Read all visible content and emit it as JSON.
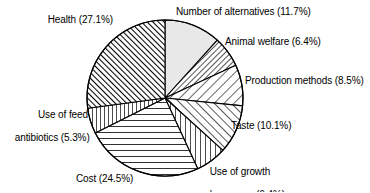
{
  "chart_data": {
    "type": "pie",
    "title": "",
    "subtitle": "",
    "xlabel": "",
    "ylabel": "",
    "legend_position": "none",
    "grid": false,
    "units": "percent",
    "start_angle_deg": 0,
    "direction": "clockwise",
    "categories": [
      "Number of alternatives",
      "Animal welfare",
      "Production methods",
      "Taste",
      "Use of growth hormones",
      "Cost",
      "Use of feed antibiotics",
      "Health"
    ],
    "values": [
      11.7,
      6.4,
      8.5,
      10.1,
      6.4,
      24.5,
      5.3,
      27.1
    ],
    "slices": [
      {
        "name": "Number of alternatives",
        "value": 11.7,
        "label": "Number of alternatives (11.7%)",
        "fill": "solid-lightgray",
        "color": "#e8e8e8"
      },
      {
        "name": "Animal welfare",
        "value": 6.4,
        "label": "Animal welfare (6.4%)",
        "fill": "hatch-backslash-dense",
        "color": "#ffffff"
      },
      {
        "name": "Production methods",
        "value": 8.5,
        "label": "Production methods (8.5%)",
        "fill": "hatch-backslash-sparse",
        "color": "#ffffff"
      },
      {
        "name": "Taste",
        "value": 10.1,
        "label": "Taste (10.1%)",
        "fill": "hatch-slash-medium",
        "color": "#ffffff"
      },
      {
        "name": "Use of growth hormones",
        "value": 6.4,
        "label": "Use of growth\nhormones (6.4%)",
        "fill": "hatch-vertical",
        "color": "#ffffff"
      },
      {
        "name": "Cost",
        "value": 24.5,
        "label": "Cost (24.5%)",
        "fill": "hatch-horizontal",
        "color": "#ffffff"
      },
      {
        "name": "Use of feed antibiotics",
        "value": 5.3,
        "label": "Use of feed\nantibiotics (5.3%)",
        "fill": "hatch-vertical",
        "color": "#ffffff"
      },
      {
        "name": "Health",
        "value": 27.1,
        "label": "Health (27.1%)",
        "fill": "hatch-slash-dense",
        "color": "#ffffff"
      }
    ]
  },
  "labels": {
    "number_of_alternatives": "Number of alternatives (11.7%)",
    "animal_welfare": "Animal welfare (6.4%)",
    "production_methods": "Production methods (8.5%)",
    "taste": "Taste (10.1%)",
    "use_of_growth_hormones_line1": "Use of growth",
    "use_of_growth_hormones_line2": "hormones (6.4%)",
    "cost": "Cost (24.5%)",
    "use_of_feed_antibiotics_line1": "Use of feed",
    "use_of_feed_antibiotics_line2": "antibiotics (5.3%)",
    "health": "Health (27.1%)"
  },
  "style": {
    "stroke": "#000000",
    "background": "#ffffff",
    "text_color": "#000000"
  }
}
